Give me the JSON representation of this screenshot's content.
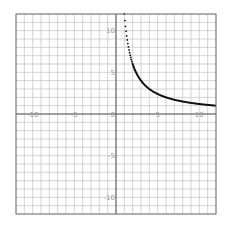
{
  "chart_data": {
    "type": "line",
    "title": "",
    "xlabel": "",
    "ylabel": "",
    "function": "y = 12/x",
    "xlim": [
      -12,
      12
    ],
    "ylim": [
      -12,
      12
    ],
    "grid": true,
    "grid_step": 1,
    "x_ticks": [
      -10,
      -5,
      5,
      10
    ],
    "y_ticks": [
      10,
      5,
      -5,
      -10
    ],
    "origin_label": "0",
    "x_tick_labels": [
      "-10",
      "-5",
      "5",
      "10"
    ],
    "y_tick_labels": [
      "10",
      "5",
      "-5",
      "-10"
    ],
    "series": [
      {
        "name": "curve",
        "style": "dotted-then-solid",
        "x": [
          1.0,
          1.1,
          1.2,
          1.3,
          1.4,
          1.5,
          1.6,
          1.7,
          1.8,
          1.9,
          2.0,
          2.5,
          3,
          3.5,
          4,
          5,
          6,
          7,
          8,
          9,
          10,
          11,
          12
        ],
        "y": [
          12.0,
          10.91,
          10.0,
          9.23,
          8.57,
          8.0,
          7.5,
          7.06,
          6.67,
          6.32,
          6.0,
          4.8,
          4.0,
          3.43,
          3.0,
          2.4,
          2.0,
          1.71,
          1.5,
          1.33,
          1.2,
          1.09,
          1.0
        ]
      }
    ],
    "colors": {
      "grid": "#c8c8c8",
      "axis": "#555555",
      "frame": "#777777",
      "curve": "#111111",
      "labels": "#9a9a9a"
    }
  }
}
